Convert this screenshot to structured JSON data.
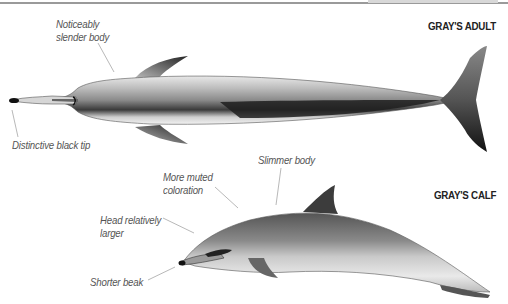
{
  "figures": [
    {
      "title": "GRAY'S ADULT",
      "labels": {
        "slender_body": [
          "Noticeably",
          "slender body"
        ],
        "black_tip": "Distinctive black tip"
      }
    },
    {
      "title": "GRAY'S CALF",
      "labels": {
        "slimmer_body": "Slimmer body",
        "muted_coloration": [
          "More muted",
          "coloration"
        ],
        "head_larger": [
          "Head relatively",
          "larger"
        ],
        "shorter_beak": "Shorter beak"
      }
    }
  ],
  "colors": {
    "line": "#9a9a9a",
    "label_text": "#555555",
    "title_text": "#222222"
  }
}
